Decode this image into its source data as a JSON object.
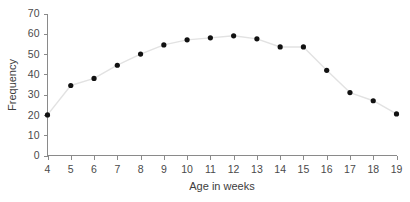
{
  "chart_data": {
    "type": "line",
    "title": "",
    "xlabel": "Age in weeks",
    "ylabel": "Frequency",
    "x": [
      4,
      5,
      6,
      7,
      8,
      9,
      10,
      11,
      12,
      13,
      14,
      15,
      16,
      17,
      18,
      19
    ],
    "values": [
      20,
      34.5,
      38,
      44.5,
      50,
      54.5,
      57,
      58,
      59,
      57.5,
      53.5,
      53.5,
      42,
      31,
      27,
      20.5
    ],
    "xlim": [
      4,
      19
    ],
    "ylim": [
      0,
      70
    ],
    "xticks": [
      4,
      5,
      6,
      7,
      8,
      9,
      10,
      11,
      12,
      13,
      14,
      15,
      16,
      17,
      18,
      19
    ],
    "yticks": [
      0,
      10,
      20,
      30,
      40,
      50,
      60,
      70
    ],
    "xtick_labels": [
      "4",
      "5",
      "6",
      "7",
      "8",
      "9",
      "10",
      "11",
      "12",
      "13",
      "14",
      "15",
      "16",
      "17",
      "18",
      "19"
    ],
    "ytick_labels": [
      "0",
      "10",
      "20",
      "30",
      "40",
      "50",
      "60",
      "70"
    ],
    "grid": false,
    "legend": false,
    "marker": "filled-circle",
    "marker_color": "#111111",
    "line_color": "#e2e2e2",
    "axis_color": "#8a8a8a",
    "text_color": "#4a4a4a",
    "background": "#ffffff"
  }
}
